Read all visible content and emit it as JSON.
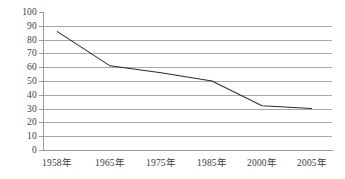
{
  "chart_data": {
    "type": "line",
    "title": "",
    "subtitle": "",
    "xlabel": "",
    "ylabel": "",
    "categories": [
      "1958年",
      "1965年",
      "1975年",
      "1985年",
      "2000年",
      "2005年"
    ],
    "x": [
      1958,
      1965,
      1975,
      1985,
      2000,
      2005
    ],
    "values": [
      86,
      61,
      56,
      50,
      32,
      30
    ],
    "series": [
      {
        "name": "",
        "values": [
          86,
          61,
          56,
          50,
          32,
          30
        ]
      }
    ],
    "ylim": [
      0,
      100
    ],
    "ytick_values": [
      100,
      90,
      80,
      70,
      60,
      50,
      40,
      30,
      20,
      10,
      0
    ],
    "ytick_labels": [
      "100",
      "90",
      "80",
      "70",
      "60",
      "50",
      "40",
      "30",
      "20",
      "10",
      "0"
    ],
    "xtick_labels": [
      "1958年",
      "1965年",
      "1975年",
      "1985年",
      "2000年",
      "2005年"
    ],
    "grid": {
      "horizontal": true,
      "vertical": false
    },
    "legend": {
      "visible": false,
      "position": "none",
      "entries": []
    },
    "annotations": [],
    "colors": {
      "line": "#2b2b2b",
      "gridline": "#a8a8a8",
      "axis": "#9a9a9a",
      "tick_label": "#3d3d3d",
      "background": "#ffffff"
    }
  },
  "geometry": {
    "plot_left": 43,
    "plot_right": 332,
    "plot_top": 12,
    "plot_bottom": 150,
    "point_x_positions": [
      57,
      110,
      161,
      212,
      262,
      312
    ]
  }
}
